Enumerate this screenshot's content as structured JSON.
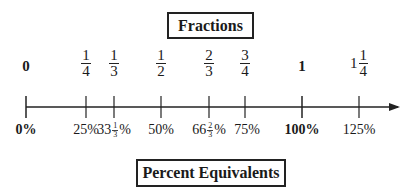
{
  "title": "Fractions",
  "subtitle": "Percent Equivalents",
  "number_line": {
    "ticks": [
      {
        "fraction": {
          "type": "whole",
          "text": "0",
          "bold": true
        },
        "percent": {
          "text": "0%",
          "bold": true
        },
        "x": 26
      },
      {
        "fraction": {
          "type": "fraction",
          "num": "1",
          "den": "4"
        },
        "percent": {
          "text": "25%"
        },
        "x": 86
      },
      {
        "fraction": {
          "type": "fraction",
          "num": "1",
          "den": "3"
        },
        "percent": {
          "whole": "33",
          "num": "1",
          "den": "3",
          "suffix": "%"
        },
        "x": 114
      },
      {
        "fraction": {
          "type": "fraction",
          "num": "1",
          "den": "2"
        },
        "percent": {
          "text": "50%"
        },
        "x": 161
      },
      {
        "fraction": {
          "type": "fraction",
          "num": "2",
          "den": "3"
        },
        "percent": {
          "whole": "66",
          "num": "2",
          "den": "3",
          "suffix": "%"
        },
        "x": 209
      },
      {
        "fraction": {
          "type": "fraction",
          "num": "3",
          "den": "4"
        },
        "percent": {
          "text": "75%"
        },
        "x": 245
      },
      {
        "fraction": {
          "type": "whole",
          "text": "1",
          "bold": true
        },
        "percent": {
          "text": "100%",
          "bold": true
        },
        "x": 302
      },
      {
        "fraction": {
          "type": "mixed",
          "whole": "1",
          "num": "1",
          "den": "4"
        },
        "percent": {
          "text": "125%"
        },
        "x": 359
      }
    ]
  }
}
